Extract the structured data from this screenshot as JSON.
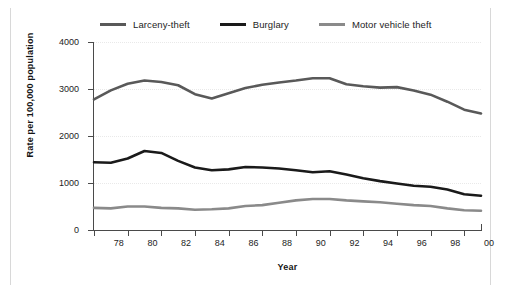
{
  "chart_data": {
    "type": "line",
    "title": "",
    "xlabel": "Year",
    "ylabel": "Rate per 100,000 population",
    "xlim": [
      1977,
      2000
    ],
    "ylim": [
      0,
      4000
    ],
    "yticks": [
      0,
      1000,
      2000,
      3000,
      4000
    ],
    "ytick_labels": [
      "0",
      "1000",
      "2000",
      "3000",
      "4000"
    ],
    "x": [
      1977,
      1978,
      1979,
      1980,
      1981,
      1982,
      1983,
      1984,
      1985,
      1986,
      1987,
      1988,
      1989,
      1990,
      1991,
      1992,
      1993,
      1994,
      1995,
      1996,
      1997,
      1998,
      1999,
      2000
    ],
    "xtick_labels": [
      "78",
      "80",
      "82",
      "84",
      "86",
      "88",
      "90",
      "92",
      "94",
      "96",
      "98",
      "00"
    ],
    "xtick_values": [
      1978,
      1980,
      1982,
      1984,
      1986,
      1988,
      1990,
      1992,
      1994,
      1996,
      1998,
      2000
    ],
    "grid": true,
    "grid_axis": "y",
    "legend_position": "top",
    "series": [
      {
        "name": "Larceny-theft",
        "color": "#595959",
        "values": [
          2780,
          2970,
          3110,
          3180,
          3150,
          3080,
          2890,
          2800,
          2910,
          3020,
          3090,
          3140,
          3180,
          3230,
          3230,
          3100,
          3060,
          3030,
          3040,
          2970,
          2880,
          2730,
          2560,
          2480
        ]
      },
      {
        "name": "Burglary",
        "color": "#1a1a1a",
        "values": [
          1440,
          1430,
          1520,
          1680,
          1640,
          1470,
          1330,
          1270,
          1290,
          1340,
          1330,
          1310,
          1270,
          1230,
          1250,
          1180,
          1100,
          1040,
          990,
          940,
          920,
          860,
          760,
          730
        ]
      },
      {
        "name": "Motor vehicle theft",
        "color": "#8a8a8a",
        "values": [
          470,
          460,
          500,
          500,
          470,
          460,
          430,
          440,
          460,
          510,
          530,
          580,
          630,
          660,
          660,
          630,
          610,
          590,
          560,
          530,
          510,
          460,
          420,
          410
        ]
      }
    ]
  },
  "legend": {
    "items": [
      {
        "label": "Larceny-theft"
      },
      {
        "label": "Burglary"
      },
      {
        "label": "Motor vehicle theft"
      }
    ]
  }
}
